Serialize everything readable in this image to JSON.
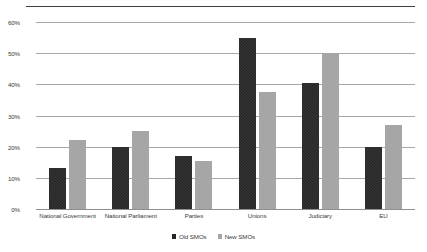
{
  "chart_data": {
    "type": "bar",
    "title": "",
    "xlabel": "",
    "ylabel": "",
    "ylim": [
      0,
      60
    ],
    "ytick_labels": [
      "60%",
      "50%",
      "40%",
      "30%",
      "20%",
      "10%",
      "0%"
    ],
    "ytick_values": [
      60,
      50,
      40,
      30,
      20,
      10,
      0
    ],
    "grid": true,
    "legend_position": "bottom",
    "categories": [
      "National Government",
      "National Parliament",
      "Parties",
      "Unions",
      "Judiciary",
      "EU"
    ],
    "series": [
      {
        "name": "Old SMOs",
        "color": "#262626",
        "values": [
          13,
          20,
          17,
          55,
          40.5,
          20
        ]
      },
      {
        "name": "New SMOs",
        "color": "#a6a6a6",
        "values": [
          22,
          25,
          15.5,
          37.5,
          50,
          27
        ]
      }
    ]
  },
  "colors": {
    "old_smos": "#262626",
    "new_smos": "#a6a6a6",
    "gridline": "#a8a8a8",
    "top_rule": "#3f3f3f",
    "text": "#3a3a3a",
    "background": "#ffffff"
  }
}
